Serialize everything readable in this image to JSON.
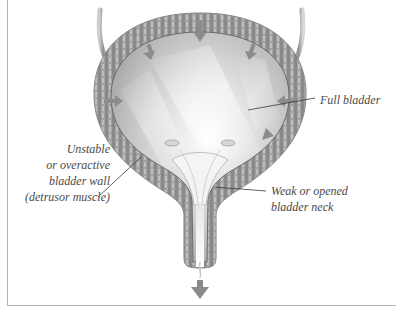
{
  "figure": {
    "type": "anatomical-illustration"
  },
  "labels": {
    "detrusor": [
      "Unstable",
      "or overactive",
      "bladder wall",
      "(detrusor muscle)"
    ],
    "full_bladder": "Full bladder",
    "bladder_neck": [
      "Weak or opened",
      "bladder neck"
    ]
  },
  "icons": {
    "flow_arrow": "arrow-down-icon",
    "pressure_arrows": "arrow-inward-icon"
  },
  "colors": {
    "frame": "#b5b5b5",
    "label_text": "#4a4a4a",
    "wall": "#8a8a8a",
    "wall_dark": "#6c6c6c",
    "lumen_light": "#f2f2f2",
    "lumen_mid": "#bdbdbd",
    "arrow": "#8c8c8c",
    "leader_line": "#3a3a3a"
  }
}
